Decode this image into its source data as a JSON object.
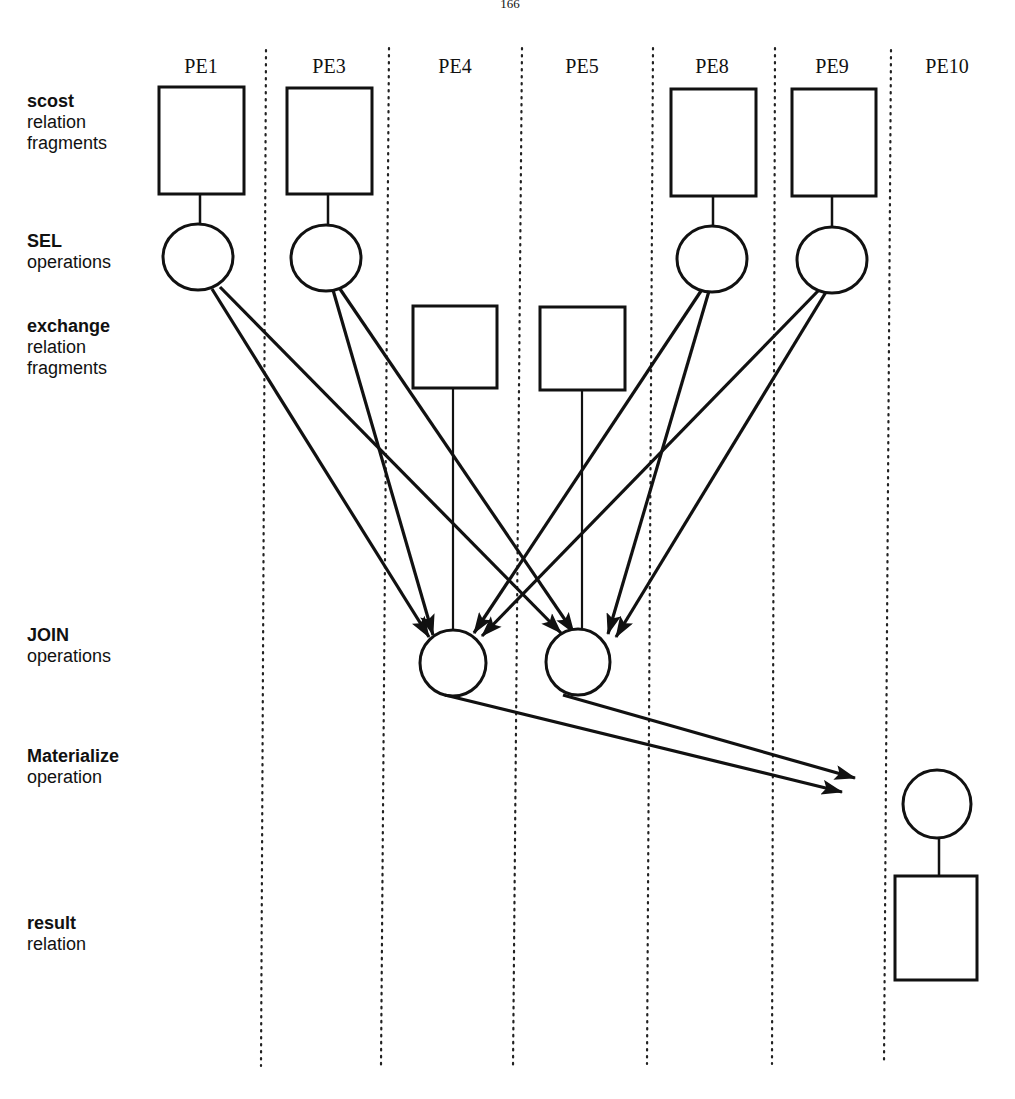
{
  "page": {
    "number": "166"
  },
  "diagram": {
    "columns": [
      {
        "id": "PE1",
        "label": "PE1"
      },
      {
        "id": "PE3",
        "label": "PE3"
      },
      {
        "id": "PE4",
        "label": "PE4"
      },
      {
        "id": "PE5",
        "label": "PE5"
      },
      {
        "id": "PE8",
        "label": "PE8"
      },
      {
        "id": "PE9",
        "label": "PE9"
      },
      {
        "id": "PE10",
        "label": "PE10"
      }
    ],
    "rows": [
      {
        "id": "scost",
        "bold": "scost",
        "lines": [
          "relation",
          "fragments"
        ]
      },
      {
        "id": "sel",
        "bold": "SEL",
        "lines": [
          "operations"
        ]
      },
      {
        "id": "exchange",
        "bold": "exchange",
        "lines": [
          "relation",
          "fragments"
        ]
      },
      {
        "id": "join",
        "bold": "JOIN",
        "lines": [
          "operations"
        ]
      },
      {
        "id": "materialize",
        "bold": "Materialize",
        "lines": [
          "operation"
        ]
      },
      {
        "id": "result",
        "bold": "result",
        "lines": [
          "relation"
        ]
      }
    ],
    "nodes": {
      "scost_fragments": [
        "PE1",
        "PE3",
        "PE8",
        "PE9"
      ],
      "sel_operations": [
        "PE1",
        "PE3",
        "PE8",
        "PE9"
      ],
      "exchange_fragments": [
        "PE4",
        "PE5"
      ],
      "join_operations": [
        "PE4",
        "PE5"
      ],
      "materialize_operation": [
        "PE10"
      ],
      "result_relation": [
        "PE10"
      ]
    },
    "edges": [
      {
        "from": "SEL@PE1",
        "to": "JOIN@PE4"
      },
      {
        "from": "SEL@PE1",
        "to": "JOIN@PE5"
      },
      {
        "from": "SEL@PE3",
        "to": "JOIN@PE4"
      },
      {
        "from": "SEL@PE3",
        "to": "JOIN@PE5"
      },
      {
        "from": "SEL@PE8",
        "to": "JOIN@PE4"
      },
      {
        "from": "SEL@PE8",
        "to": "JOIN@PE5"
      },
      {
        "from": "SEL@PE9",
        "to": "JOIN@PE4"
      },
      {
        "from": "SEL@PE9",
        "to": "JOIN@PE5"
      },
      {
        "from": "exchange@PE4",
        "to": "JOIN@PE4"
      },
      {
        "from": "exchange@PE5",
        "to": "JOIN@PE5"
      },
      {
        "from": "JOIN@PE4",
        "to": "Materialize@PE10"
      },
      {
        "from": "JOIN@PE5",
        "to": "Materialize@PE10"
      },
      {
        "from": "Materialize@PE10",
        "to": "result@PE10"
      }
    ]
  }
}
